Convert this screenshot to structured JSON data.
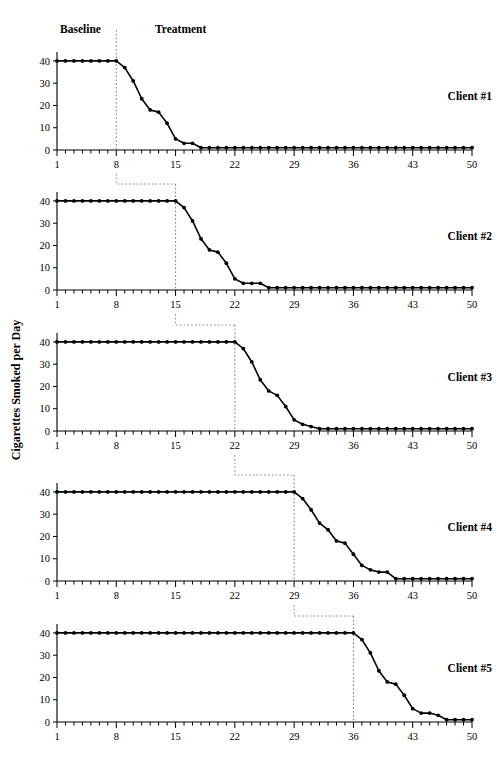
{
  "figure": {
    "title_y_axis": "Cigarettes Smoked per Day",
    "phase_labels": {
      "baseline": "Baseline",
      "treatment": "Treatment"
    },
    "line_color": "#000000",
    "point_color": "#000000",
    "phase_line_color": "#777777",
    "background": "#ffffff"
  },
  "chart_data": {
    "type": "line",
    "title": "",
    "xlabel": "",
    "ylabel": "Cigarettes Smoked per Day",
    "xlim": [
      1,
      50
    ],
    "ylim": [
      0,
      44
    ],
    "yticks": [
      0,
      10,
      20,
      30,
      40
    ],
    "ytick_labels": [
      "0",
      "10",
      "20",
      "30",
      "40"
    ],
    "xticks": [
      1,
      8,
      15,
      22,
      29,
      36,
      43,
      50
    ],
    "xtick_labels": [
      "1",
      "8",
      "15",
      "22",
      "29",
      "36",
      "43",
      "50"
    ],
    "minor_xtick_every": 1,
    "grid": false,
    "legend": "none",
    "annotations": [
      "Baseline",
      "Treatment"
    ],
    "baseline_value": 40,
    "panels": [
      {
        "name": "Client #1",
        "label": "Client #1",
        "intervention_session": 8,
        "x": [
          1,
          2,
          3,
          4,
          5,
          6,
          7,
          8,
          9,
          10,
          11,
          12,
          13,
          14,
          15,
          16,
          17,
          18,
          19,
          20,
          21,
          22,
          23,
          24,
          25,
          26,
          27,
          28,
          29,
          30,
          31,
          32,
          33,
          34,
          35,
          36,
          37,
          38,
          39,
          40,
          41,
          42,
          43,
          44,
          45,
          46,
          47,
          48,
          49,
          50
        ],
        "y": [
          40,
          40,
          40,
          40,
          40,
          40,
          40,
          40,
          37,
          31,
          23,
          18,
          17,
          12,
          5,
          3,
          3,
          1,
          1,
          1,
          1,
          1,
          1,
          1,
          1,
          1,
          1,
          1,
          1,
          1,
          1,
          1,
          1,
          1,
          1,
          1,
          1,
          1,
          1,
          1,
          1,
          1,
          1,
          1,
          1,
          1,
          1,
          1,
          1,
          1
        ]
      },
      {
        "name": "Client #2",
        "label": "Client #2",
        "intervention_session": 15,
        "x": [
          1,
          2,
          3,
          4,
          5,
          6,
          7,
          8,
          9,
          10,
          11,
          12,
          13,
          14,
          15,
          16,
          17,
          18,
          19,
          20,
          21,
          22,
          23,
          24,
          25,
          26,
          27,
          28,
          29,
          30,
          31,
          32,
          33,
          34,
          35,
          36,
          37,
          38,
          39,
          40,
          41,
          42,
          43,
          44,
          45,
          46,
          47,
          48,
          49,
          50
        ],
        "y": [
          40,
          40,
          40,
          40,
          40,
          40,
          40,
          40,
          40,
          40,
          40,
          40,
          40,
          40,
          40,
          37,
          31,
          23,
          18,
          17,
          12,
          5,
          3,
          3,
          3,
          1,
          1,
          1,
          1,
          1,
          1,
          1,
          1,
          1,
          1,
          1,
          1,
          1,
          1,
          1,
          1,
          1,
          1,
          1,
          1,
          1,
          1,
          1,
          1,
          1
        ]
      },
      {
        "name": "Client #3",
        "label": "Client #3",
        "intervention_session": 22,
        "x": [
          1,
          2,
          3,
          4,
          5,
          6,
          7,
          8,
          9,
          10,
          11,
          12,
          13,
          14,
          15,
          16,
          17,
          18,
          19,
          20,
          21,
          22,
          23,
          24,
          25,
          26,
          27,
          28,
          29,
          30,
          31,
          32,
          33,
          34,
          35,
          36,
          37,
          38,
          39,
          40,
          41,
          42,
          43,
          44,
          45,
          46,
          47,
          48,
          49,
          50
        ],
        "y": [
          40,
          40,
          40,
          40,
          40,
          40,
          40,
          40,
          40,
          40,
          40,
          40,
          40,
          40,
          40,
          40,
          40,
          40,
          40,
          40,
          40,
          40,
          37,
          31,
          23,
          18,
          16,
          11,
          5,
          3,
          2,
          1,
          1,
          1,
          1,
          1,
          1,
          1,
          1,
          1,
          1,
          1,
          1,
          1,
          1,
          1,
          1,
          1,
          1,
          1
        ]
      },
      {
        "name": "Client #4",
        "label": "Client #4",
        "intervention_session": 29,
        "x": [
          1,
          2,
          3,
          4,
          5,
          6,
          7,
          8,
          9,
          10,
          11,
          12,
          13,
          14,
          15,
          16,
          17,
          18,
          19,
          20,
          21,
          22,
          23,
          24,
          25,
          26,
          27,
          28,
          29,
          30,
          31,
          32,
          33,
          34,
          35,
          36,
          37,
          38,
          39,
          40,
          41,
          42,
          43,
          44,
          45,
          46,
          47,
          48,
          49,
          50
        ],
        "y": [
          40,
          40,
          40,
          40,
          40,
          40,
          40,
          40,
          40,
          40,
          40,
          40,
          40,
          40,
          40,
          40,
          40,
          40,
          40,
          40,
          40,
          40,
          40,
          40,
          40,
          40,
          40,
          40,
          40,
          37,
          32,
          26,
          23,
          18,
          17,
          12,
          7,
          5,
          4,
          4,
          1,
          1,
          1,
          1,
          1,
          1,
          1,
          1,
          1,
          1
        ]
      },
      {
        "name": "Client #5",
        "label": "Client #5",
        "intervention_session": 36,
        "x": [
          1,
          2,
          3,
          4,
          5,
          6,
          7,
          8,
          9,
          10,
          11,
          12,
          13,
          14,
          15,
          16,
          17,
          18,
          19,
          20,
          21,
          22,
          23,
          24,
          25,
          26,
          27,
          28,
          29,
          30,
          31,
          32,
          33,
          34,
          35,
          36,
          37,
          38,
          39,
          40,
          41,
          42,
          43,
          44,
          45,
          46,
          47,
          48,
          49,
          50
        ],
        "y": [
          40,
          40,
          40,
          40,
          40,
          40,
          40,
          40,
          40,
          40,
          40,
          40,
          40,
          40,
          40,
          40,
          40,
          40,
          40,
          40,
          40,
          40,
          40,
          40,
          40,
          40,
          40,
          40,
          40,
          40,
          40,
          40,
          40,
          40,
          40,
          40,
          37,
          31,
          23,
          18,
          17,
          12,
          6,
          4,
          4,
          3,
          1,
          1,
          1,
          1
        ]
      }
    ],
    "connectors": [
      {
        "from_panel": 0,
        "to_panel": 1,
        "from_session": 8,
        "to_session": 15
      },
      {
        "from_panel": 1,
        "to_panel": 2,
        "from_session": 15,
        "to_session": 22
      },
      {
        "from_panel": 2,
        "to_panel": 3,
        "from_session": 22,
        "to_session": 29
      },
      {
        "from_panel": 3,
        "to_panel": 4,
        "from_session": 29,
        "to_session": 36
      }
    ]
  }
}
